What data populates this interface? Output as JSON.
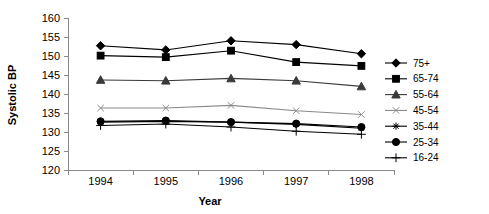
{
  "chart_data": {
    "type": "line",
    "title": "",
    "xlabel": "Year",
    "ylabel": "Systolic BP",
    "categories": [
      "1994",
      "1995",
      "1996",
      "1997",
      "1998"
    ],
    "ylim": [
      120,
      160
    ],
    "yticks": [
      120,
      125,
      130,
      135,
      140,
      145,
      150,
      155,
      160
    ],
    "grid": false,
    "legend_position": "right",
    "series": [
      {
        "name": "75+",
        "marker": "diamond",
        "color": "#000000",
        "values": [
          152.7,
          151.6,
          154.0,
          153.0,
          150.6
        ]
      },
      {
        "name": "65-74",
        "marker": "square",
        "color": "#000000",
        "values": [
          150.1,
          149.7,
          151.4,
          148.4,
          147.4
        ]
      },
      {
        "name": "55-64",
        "marker": "triangle",
        "color": "#3a3a3a",
        "values": [
          143.7,
          143.5,
          144.1,
          143.5,
          142.0
        ]
      },
      {
        "name": "45-54",
        "marker": "cross",
        "color": "#8a8a8a",
        "values": [
          136.3,
          136.3,
          137.0,
          135.6,
          134.6
        ]
      },
      {
        "name": "35-44",
        "marker": "star",
        "color": "#000000",
        "values": [
          132.6,
          132.8,
          132.6,
          132.0,
          131.0
        ]
      },
      {
        "name": "25-34",
        "marker": "circle",
        "color": "#000000",
        "values": [
          132.8,
          133.0,
          132.6,
          132.2,
          131.3
        ]
      },
      {
        "name": "16-24",
        "marker": "plus",
        "color": "#000000",
        "values": [
          131.7,
          132.1,
          131.3,
          130.2,
          129.4
        ]
      }
    ]
  }
}
